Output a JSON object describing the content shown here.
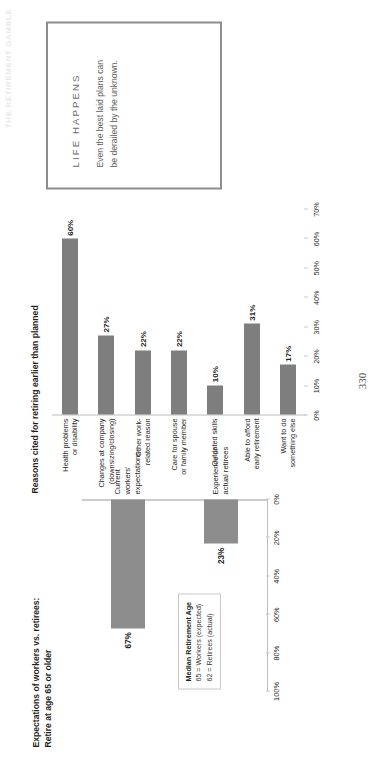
{
  "page": {
    "number": "330",
    "running_header": "THE RETIREMENT GAMBLE"
  },
  "callout": {
    "heading": "LIFE HAPPENS",
    "body": "Even the best laid plans can be derailed by the unknown."
  },
  "chart_b": {
    "title": "Reasons cited for retiring earlier than planned"
  },
  "chart_a": {
    "title_line1": "Expectations of workers vs. retirees:",
    "title_line2": "Retire at age 65 or older",
    "legend": {
      "heading": "Median Retirement Age",
      "line1": "65 = Workers (expected)",
      "line2": "62 = Retirees (actual)"
    }
  },
  "chart_data": [
    {
      "id": "reasons-cited",
      "type": "bar",
      "orientation": "horizontal",
      "title": "Reasons cited for retiring earlier than planned",
      "xlabel": "",
      "ylabel": "",
      "xlim": [
        0,
        70
      ],
      "grid": false,
      "legend": "none",
      "bar_color": "#7e7e7e",
      "categories": [
        "Health problems or disability",
        "Changes at company (downsizing/closing)",
        "Other work-related reason",
        "Care for spouse or family member",
        "Outdated skills",
        "Able to afford early retirement",
        "Want to do something else"
      ],
      "category_lines": [
        [
          "Health problems",
          "or disability"
        ],
        [
          "Changes at company",
          "(downsizing/closing)"
        ],
        [
          "Other work-",
          "related reason"
        ],
        [
          "Care for spouse",
          "or family member"
        ],
        [
          "Outdated skills"
        ],
        [
          "Able to afford",
          "early retirement"
        ],
        [
          "Want to do",
          "something else"
        ]
      ],
      "values": [
        60,
        27,
        22,
        22,
        10,
        31,
        17
      ],
      "data_labels": [
        "60%",
        "27%",
        "22%",
        "22%",
        "10%",
        "31%",
        "17%"
      ],
      "xticks": [
        0,
        10,
        20,
        30,
        40,
        50,
        60,
        70
      ],
      "xticklabels": [
        "0%",
        "10%",
        "20%",
        "30%",
        "40%",
        "50%",
        "60%",
        "70%"
      ]
    },
    {
      "id": "retire-at-65-or-older",
      "type": "bar",
      "orientation": "horizontal",
      "title": "Expectations of workers vs. retirees: Retire at age 65 or older",
      "xlabel": "",
      "ylabel": "",
      "xlim": [
        0,
        100
      ],
      "grid": false,
      "legend": "none",
      "bar_color": "#8d8d8d",
      "categories": [
        "Current workers' expectations",
        "Experience of actual retirees"
      ],
      "category_lines": [
        [
          "Current workers'",
          "expectations"
        ],
        [
          "Experience of",
          "actual retirees"
        ]
      ],
      "values": [
        67,
        23
      ],
      "data_labels": [
        "67%",
        "23%"
      ],
      "xticks": [
        0,
        20,
        40,
        60,
        80,
        100
      ],
      "xticklabels": [
        "0%",
        "20%",
        "40%",
        "60%",
        "80%",
        "100%"
      ],
      "annotation": "Median Retirement Age / 65 = Workers (expected) / 62 = Retirees (actual)"
    }
  ]
}
